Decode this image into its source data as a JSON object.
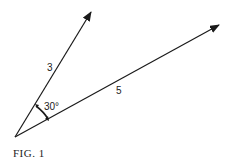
{
  "figure": {
    "caption": "FIG. 1",
    "vectors": [
      {
        "id": "short",
        "label": "3",
        "start": [
          15,
          137
        ],
        "end": [
          92,
          10
        ]
      },
      {
        "id": "long",
        "label": "5",
        "start": [
          15,
          137
        ],
        "end": [
          220,
          24
        ]
      }
    ],
    "angle": {
      "label": "30°",
      "between": [
        "short",
        "long"
      ]
    }
  },
  "colors": {
    "stroke": "#1a1a1a",
    "text": "#222222",
    "background": "#ffffff"
  }
}
